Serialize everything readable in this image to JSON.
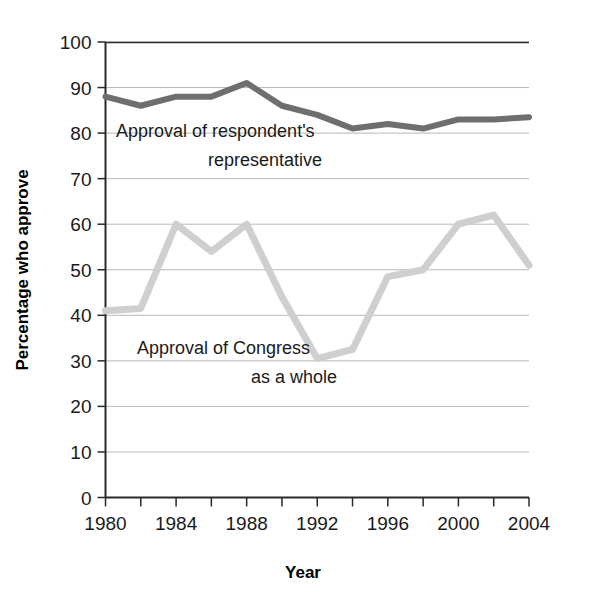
{
  "chart_data": {
    "type": "line",
    "title": "",
    "xlabel": "Year",
    "ylabel": "Percentage who approve",
    "xlim": [
      1980,
      2004
    ],
    "ylim": [
      0,
      100
    ],
    "ytick_step": 10,
    "xtick_step": 2,
    "grid": true,
    "legend_position": "inline-annotations",
    "x": [
      1980,
      1982,
      1984,
      1986,
      1988,
      1990,
      1992,
      1994,
      1996,
      1998,
      2000,
      2002,
      2004
    ],
    "y_ticks": [
      0,
      10,
      20,
      30,
      40,
      50,
      60,
      70,
      80,
      90,
      100
    ],
    "y_tick_labels": [
      "0",
      "10",
      "20",
      "30",
      "40",
      "50",
      "60",
      "70",
      "80",
      "90",
      "100"
    ],
    "x_ticks": [
      1980,
      1982,
      1984,
      1986,
      1988,
      1990,
      1992,
      1994,
      1996,
      1998,
      2000,
      2002,
      2004
    ],
    "x_tick_labels": [
      "1980",
      "",
      "1984",
      "",
      "1988",
      "",
      "1992",
      "",
      "1996",
      "",
      "2000",
      "",
      "2004"
    ],
    "x_major_labels": [
      "1980",
      "1984",
      "1988",
      "1992",
      "1996",
      "2000",
      "2004"
    ],
    "series": [
      {
        "name": "Approval of respondent's representative",
        "color": "#6e6e6e",
        "values": [
          88,
          86,
          88,
          88,
          91,
          86,
          84,
          81,
          82,
          81,
          83,
          83,
          83.5
        ]
      },
      {
        "name": "Approval of Congress as a whole",
        "color": "#cfcfcf",
        "values": [
          41,
          41.5,
          60,
          54,
          60,
          44,
          30.5,
          32.5,
          48.5,
          50,
          60,
          62,
          51
        ]
      }
    ],
    "annotations": [
      {
        "id": "annotation-representative",
        "line1": "Approval of respondent's",
        "line2": "representative"
      },
      {
        "id": "annotation-congress",
        "line1": "Approval of Congress",
        "line2": "as a whole"
      }
    ]
  },
  "colors": {
    "dark_line": "#6e6e6e",
    "light_line": "#cfcfcf",
    "grid": "#b8b8b8",
    "axis": "#2a2a2a",
    "text": "#1a1a1a",
    "background": "#ffffff"
  }
}
